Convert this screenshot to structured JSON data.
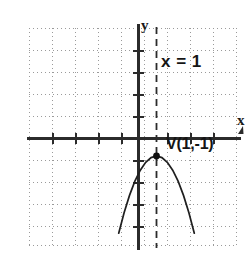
{
  "chart_data": {
    "type": "line",
    "title": "",
    "subtitle": "",
    "xlabel": "x",
    "ylabel": "y",
    "grid": true,
    "grid_style": "dotted",
    "legend": "none",
    "xlim": [
      -5,
      4
    ],
    "ylim": [
      -5,
      5
    ],
    "x_tick_step": 1,
    "y_tick_step": 1,
    "tick_labels_shown": false,
    "series": [
      {
        "name": "parabola",
        "type": "line",
        "equation": "y = -(x - 1)^2 - 1",
        "direction": "opens-down",
        "vertex": [
          1,
          -1
        ],
        "x": [
          -1.1,
          -0.8,
          -0.5,
          -0.2,
          0.1,
          0.4,
          0.7,
          1.0,
          1.3,
          1.6,
          1.9,
          2.2,
          2.5,
          2.8,
          3.1
        ],
        "y": [
          -5.41,
          -4.24,
          -3.25,
          -2.44,
          -1.81,
          -1.36,
          -1.09,
          -1.0,
          -1.09,
          -1.36,
          -1.81,
          -2.44,
          -3.25,
          -4.24,
          -5.41
        ]
      },
      {
        "name": "axis-of-symmetry",
        "type": "line",
        "style": "dashed",
        "equation": "x = 1",
        "x": [
          1,
          1
        ],
        "y": [
          -5,
          5
        ]
      }
    ],
    "points": [
      {
        "name": "vertex",
        "x": 1,
        "y": -1,
        "marker": "dot",
        "label": "V(1, -1)"
      }
    ],
    "annotations": [
      {
        "name": "axis-of-symmetry-label",
        "text": "x = 1",
        "x": 1.35,
        "y": 3.8
      },
      {
        "name": "vertex-label",
        "text": "V(1, -1)",
        "x": 1.3,
        "y": -1.0
      }
    ]
  },
  "labels": {
    "y_axis": "y",
    "x_axis": "x",
    "line_equation": "x = 1",
    "vertex_point": "V(1,-1)"
  },
  "colors": {
    "background": "#ffffff",
    "axis": "#2b2b2b",
    "grid": "#9a9a9a",
    "curve": "#1f1f1f",
    "dashed_line": "#2b2b2b",
    "text": "#151515"
  }
}
